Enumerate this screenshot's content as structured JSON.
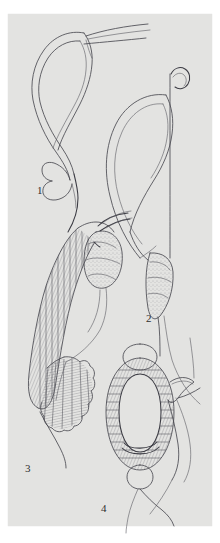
{
  "plate": {
    "background_color": "#ffffff",
    "panel_color": "#e3e3e1",
    "ink_color": "#4a4a52",
    "label_color": "#2e2e2e",
    "panel": {
      "x": 8,
      "y": 14,
      "width": 204,
      "height": 512
    },
    "caption_note": "",
    "figures": [
      {
        "number": "1",
        "label": "1",
        "label_x": 37,
        "label_y": 194,
        "description": "hook-shaped structure with double outline and basal notch, with two long tapering processes extending to upper right",
        "shading": "none"
      },
      {
        "number": "2",
        "label": "2",
        "label_x": 146,
        "label_y": 322,
        "description": "elongate looped structure with slender stalk bearing a small recurved hook at its apex and a stippled tapering terminal lobe",
        "shading": "stipple"
      },
      {
        "number": "3",
        "label": "3",
        "label_x": 25,
        "label_y": 472,
        "description": "hatched curved tube with oval sac at apex, paired slender apical spines, and a scalloped fan-shaped distal expansion",
        "shading": "hatch"
      },
      {
        "number": "4",
        "label": "4",
        "label_x": 101,
        "label_y": 512,
        "description": "hatched annular ring with small circle at apex and at base, and a pointed lateral projection on the right",
        "shading": "hatch"
      }
    ]
  }
}
